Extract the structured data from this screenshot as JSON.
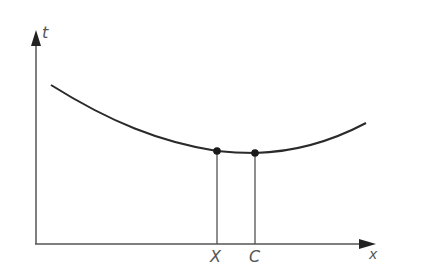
{
  "diagram": {
    "type": "graph",
    "axes": {
      "y_label": "t",
      "x_label": "x",
      "origin": [
        36,
        244
      ],
      "y_axis_top": 31,
      "x_axis_right": 375
    },
    "curve": {
      "description": "U-shaped cost curve t(x), decreasing then increasing",
      "points": [
        [
          51,
          85
        ],
        [
          100,
          116
        ],
        [
          160,
          138
        ],
        [
          200,
          149
        ],
        [
          217,
          151
        ],
        [
          255,
          153
        ],
        [
          300,
          148
        ],
        [
          330,
          140
        ],
        [
          366,
          123
        ]
      ]
    },
    "markers": [
      {
        "label": "X",
        "x": 217,
        "y": 151
      },
      {
        "label": "C",
        "x": 255,
        "y": 153
      }
    ],
    "colors": {
      "line": "#2a2a2a",
      "axis": "#444444",
      "label": "#555555"
    }
  }
}
